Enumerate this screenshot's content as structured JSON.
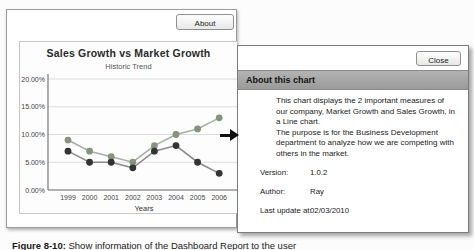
{
  "report_window": {
    "about_button_label": "About"
  },
  "chart_data": {
    "type": "line",
    "title": "Sales Growth vs Market Growth",
    "subtitle": "Historic Trend",
    "xlabel": "Years",
    "ylabel": "",
    "categories": [
      "1999",
      "2000",
      "2001",
      "2002",
      "2003",
      "2004",
      "2005",
      "2006"
    ],
    "series": [
      {
        "name": "Market Growth",
        "values": [
          9,
          7,
          6,
          5,
          8,
          10,
          11,
          13
        ],
        "line_color": "#a7b0a7",
        "marker_color": "#86937f"
      },
      {
        "name": "Sales Growth",
        "values": [
          7,
          5,
          5,
          4,
          7,
          8,
          5,
          3
        ],
        "line_color": "#8c8c8c",
        "marker_color": "#333333"
      }
    ],
    "ylim": [
      0,
      20
    ],
    "yticks": [
      {
        "v": 0,
        "label": "0.00%"
      },
      {
        "v": 5,
        "label": "5.00%"
      },
      {
        "v": 10,
        "label": "10.00%"
      },
      {
        "v": 15,
        "label": "15.00%"
      },
      {
        "v": 20,
        "label": "20.00%"
      }
    ],
    "grid": true,
    "legend": "none"
  },
  "dialog": {
    "close_button_label": "Close",
    "title": "About this chart",
    "body_paragraphs": {
      "p1": "This chart displays the 2 important measures of our company, Market Growth and Sales Growth, in a Line chart.",
      "p2": "The purpose is for the Business Development department to analyze how we are competing with others in the market."
    },
    "fields": [
      {
        "label": "Version:",
        "value": "1.0.2"
      },
      {
        "label": "Author:",
        "value": "Ray"
      },
      {
        "label": "Last update at:",
        "value": "02/03/2010"
      }
    ]
  },
  "caption": {
    "prefix": "Figure 8-10:",
    "text": "Show information of the Dashboard Report to the user"
  },
  "colors": {
    "dialog_titlebar": "#a6a6a6",
    "arrow": "#101010",
    "grid_line": "#dcdcdc",
    "axis_line": "#777777"
  }
}
